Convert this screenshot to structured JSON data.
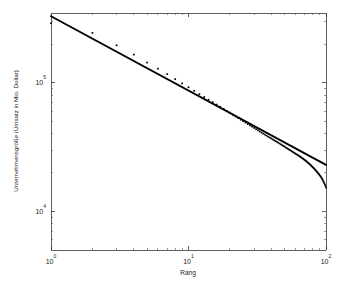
{
  "figure": {
    "background_color": "#ffffff",
    "axis_color": "#3a3a3a",
    "data_color": "#000000",
    "fit_color": "#000000"
  },
  "axis": {
    "x_title": "Rang",
    "y_title": "Unternehmensgröße (Umsatz in Mio. Dollar)",
    "x_tick_labels": [
      "10",
      "10",
      "10"
    ],
    "x_tick_exponents": [
      "0",
      "1",
      "2"
    ],
    "y_tick_labels": [
      "10",
      "10"
    ],
    "y_tick_exponents": [
      "5",
      "4"
    ]
  },
  "chart_data": {
    "type": "scatter",
    "title": "",
    "subtitle": "",
    "xlabel": "Rang",
    "ylabel": "Unternehmensgröße (Umsatz in Mio. Dollar)",
    "xscale": "log",
    "yscale": "log",
    "xlim": [
      1,
      100
    ],
    "ylim": [
      5000,
      350000
    ],
    "grid": false,
    "legend": null,
    "legend_position": "none",
    "x_ticks": [
      1,
      10,
      100
    ],
    "x_tick_text": [
      "10^0",
      "10^1",
      "10^2"
    ],
    "y_ticks": [
      10000,
      100000
    ],
    "y_tick_text": [
      "10^4",
      "10^5"
    ],
    "series": [
      {
        "name": "Unternehmen (Rang-Größe)",
        "type": "scatter",
        "marker": "point",
        "x": [
          1,
          2,
          3,
          4,
          5,
          6,
          7,
          8,
          9,
          10,
          11,
          12,
          13,
          14,
          15,
          16,
          17,
          18,
          19,
          20,
          21,
          22,
          23,
          24,
          25,
          26,
          27,
          28,
          29,
          30,
          31,
          32,
          33,
          34,
          35,
          36,
          37,
          38,
          39,
          40,
          41,
          42,
          43,
          44,
          45,
          46,
          47,
          48,
          49,
          50,
          51,
          52,
          53,
          54,
          55,
          56,
          57,
          58,
          59,
          60,
          61,
          62,
          63,
          64,
          65,
          66,
          67,
          68,
          69,
          70,
          71,
          72,
          73,
          74,
          75,
          76,
          77,
          78,
          79,
          80,
          81,
          82,
          83,
          84,
          85,
          86,
          87,
          88,
          89,
          90,
          91,
          92,
          93,
          94,
          95,
          96,
          97,
          98,
          99,
          100
        ],
        "y": [
          291000,
          245000,
          196000,
          166000,
          144000,
          129000,
          117000,
          107000,
          99000,
          92500,
          86800,
          81800,
          77600,
          73900,
          70700,
          67800,
          65200,
          62800,
          60600,
          58600,
          56600,
          54800,
          53200,
          51700,
          50300,
          49000,
          47800,
          46600,
          45600,
          44600,
          43600,
          42700,
          41800,
          41000,
          40200,
          39500,
          38800,
          38100,
          37500,
          36900,
          36300,
          35700,
          35200,
          34700,
          34200,
          33700,
          33200,
          32700,
          32300,
          31900,
          31400,
          31000,
          30600,
          30200,
          29900,
          29500,
          29100,
          28800,
          28400,
          28100,
          27800,
          27500,
          27200,
          26900,
          26600,
          26300,
          26000,
          25700,
          25400,
          25100,
          24800,
          24500,
          24200,
          23900,
          23600,
          23300,
          23000,
          22700,
          22400,
          22100,
          21800,
          21500,
          21200,
          20900,
          20600,
          20300,
          20000,
          19700,
          19400,
          19100,
          18800,
          18500,
          18100,
          17800,
          17400,
          17000,
          16600,
          16200,
          15800,
          15300
        ]
      },
      {
        "name": "Zipf-Anpassungsgerade",
        "type": "line",
        "x": [
          1,
          100
        ],
        "y": [
          330000,
          23000
        ],
        "slope": -0.5787
      }
    ]
  }
}
